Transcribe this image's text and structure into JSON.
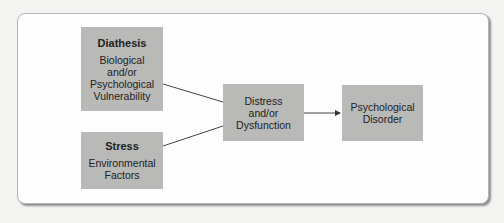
{
  "diagram": {
    "nodes": [
      {
        "id": "diathesis",
        "title": "Diathesis",
        "body": "Biological\nand/or\nPsychological\nVulnerability"
      },
      {
        "id": "stress",
        "title": "Stress",
        "body": "Environmental\nFactors"
      },
      {
        "id": "distress",
        "title": "",
        "body": "Distress\nand/or\nDysfunction"
      },
      {
        "id": "disorder",
        "title": "",
        "body": "Psychological\nDisorder"
      }
    ],
    "edges": [
      {
        "from": "diathesis",
        "to": "distress",
        "arrow": false
      },
      {
        "from": "stress",
        "to": "distress",
        "arrow": false
      },
      {
        "from": "distress",
        "to": "disorder",
        "arrow": true
      }
    ],
    "colors": {
      "box": "#b9b9b8",
      "line": "#333333",
      "frame": "#fdfdfd"
    }
  }
}
